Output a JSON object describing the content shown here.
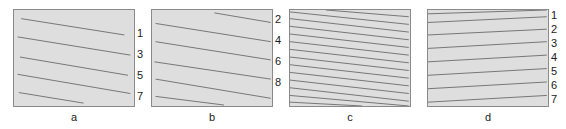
{
  "figure": {
    "background_color": "#ffffff",
    "panel_fill_color": "#dedede",
    "panel_border_color": "#8a8a8a",
    "line_color": "#4a4a4a",
    "text_color": "#1a1a1a"
  },
  "panels": [
    {
      "id": "a",
      "caption": "a",
      "box": {
        "x": 13,
        "y": 9,
        "w": 122,
        "h": 98
      },
      "caption_box": {
        "x": 13,
        "y": 111,
        "w": 122
      },
      "tick_labels_x": 137,
      "tick_labels": [
        {
          "text": "1",
          "y": 28
        },
        {
          "text": "3",
          "y": 49
        },
        {
          "text": "5",
          "y": 70
        },
        {
          "text": "7",
          "y": 91
        }
      ],
      "lines": [
        {
          "x1": 0.06,
          "y1": 0.09,
          "x2": 0.92,
          "y2": 0.26
        },
        {
          "x1": 0.03,
          "y1": 0.28,
          "x2": 0.97,
          "y2": 0.47
        },
        {
          "x1": 0.05,
          "y1": 0.49,
          "x2": 0.95,
          "y2": 0.68
        },
        {
          "x1": 0.03,
          "y1": 0.67,
          "x2": 0.97,
          "y2": 0.87
        },
        {
          "x1": 0.04,
          "y1": 0.86,
          "x2": 0.58,
          "y2": 0.97
        }
      ]
    },
    {
      "id": "b",
      "caption": "b",
      "box": {
        "x": 151,
        "y": 9,
        "w": 122,
        "h": 98
      },
      "caption_box": {
        "x": 151,
        "y": 111,
        "w": 122
      },
      "tick_labels_x": 275,
      "tick_labels": [
        {
          "text": "2",
          "y": 14
        },
        {
          "text": "4",
          "y": 35
        },
        {
          "text": "6",
          "y": 56
        },
        {
          "text": "8",
          "y": 77
        }
      ],
      "lines": [
        {
          "x1": 0.52,
          "y1": 0.03,
          "x2": 0.99,
          "y2": 0.13
        },
        {
          "x1": 0.03,
          "y1": 0.14,
          "x2": 0.99,
          "y2": 0.33
        },
        {
          "x1": 0.03,
          "y1": 0.33,
          "x2": 0.99,
          "y2": 0.52
        },
        {
          "x1": 0.02,
          "y1": 0.54,
          "x2": 0.99,
          "y2": 0.72
        },
        {
          "x1": 0.03,
          "y1": 0.72,
          "x2": 0.99,
          "y2": 0.92
        },
        {
          "x1": 0.03,
          "y1": 0.9,
          "x2": 0.6,
          "y2": 0.99
        }
      ]
    },
    {
      "id": "c",
      "caption": "c",
      "box": {
        "x": 289,
        "y": 9,
        "w": 122,
        "h": 98
      },
      "caption_box": {
        "x": 289,
        "y": 111,
        "w": 122
      },
      "tick_labels_x": 413,
      "tick_labels": [],
      "lines": [
        {
          "x1": 0.3,
          "y1": 0.0,
          "x2": 0.99,
          "y2": 0.07
        },
        {
          "x1": 0.0,
          "y1": 0.02,
          "x2": 0.99,
          "y2": 0.15
        },
        {
          "x1": 0.0,
          "y1": 0.09,
          "x2": 0.99,
          "y2": 0.23
        },
        {
          "x1": 0.0,
          "y1": 0.17,
          "x2": 0.99,
          "y2": 0.31
        },
        {
          "x1": 0.0,
          "y1": 0.25,
          "x2": 0.99,
          "y2": 0.39
        },
        {
          "x1": 0.0,
          "y1": 0.33,
          "x2": 0.99,
          "y2": 0.47
        },
        {
          "x1": 0.0,
          "y1": 0.41,
          "x2": 0.99,
          "y2": 0.55
        },
        {
          "x1": 0.0,
          "y1": 0.49,
          "x2": 0.99,
          "y2": 0.63
        },
        {
          "x1": 0.0,
          "y1": 0.57,
          "x2": 0.99,
          "y2": 0.71
        },
        {
          "x1": 0.0,
          "y1": 0.65,
          "x2": 0.99,
          "y2": 0.79
        },
        {
          "x1": 0.0,
          "y1": 0.73,
          "x2": 0.99,
          "y2": 0.87
        },
        {
          "x1": 0.0,
          "y1": 0.81,
          "x2": 0.99,
          "y2": 0.95
        },
        {
          "x1": 0.0,
          "y1": 0.89,
          "x2": 0.99,
          "y2": 1.0
        },
        {
          "x1": 0.0,
          "y1": 0.96,
          "x2": 0.6,
          "y2": 1.0
        }
      ]
    },
    {
      "id": "d",
      "caption": "d",
      "box": {
        "x": 427,
        "y": 9,
        "w": 122,
        "h": 98
      },
      "caption_box": {
        "x": 427,
        "y": 111,
        "w": 122
      },
      "tick_labels_x": 551,
      "tick_labels": [
        {
          "text": "1",
          "y": 10
        },
        {
          "text": "2",
          "y": 24
        },
        {
          "text": "3",
          "y": 38
        },
        {
          "text": "4",
          "y": 52
        },
        {
          "text": "5",
          "y": 66
        },
        {
          "text": "6",
          "y": 80
        },
        {
          "text": "7",
          "y": 94
        }
      ],
      "lines": [
        {
          "x1": 0.0,
          "y1": 0.04,
          "x2": 0.99,
          "y2": 0.0
        },
        {
          "x1": 0.0,
          "y1": 0.13,
          "x2": 0.99,
          "y2": 0.07
        },
        {
          "x1": 0.0,
          "y1": 0.26,
          "x2": 0.99,
          "y2": 0.2
        },
        {
          "x1": 0.0,
          "y1": 0.4,
          "x2": 0.99,
          "y2": 0.33
        },
        {
          "x1": 0.0,
          "y1": 0.54,
          "x2": 0.99,
          "y2": 0.47
        },
        {
          "x1": 0.0,
          "y1": 0.68,
          "x2": 0.99,
          "y2": 0.61
        },
        {
          "x1": 0.0,
          "y1": 0.82,
          "x2": 0.99,
          "y2": 0.75
        },
        {
          "x1": 0.0,
          "y1": 0.96,
          "x2": 0.99,
          "y2": 0.89
        }
      ]
    }
  ]
}
